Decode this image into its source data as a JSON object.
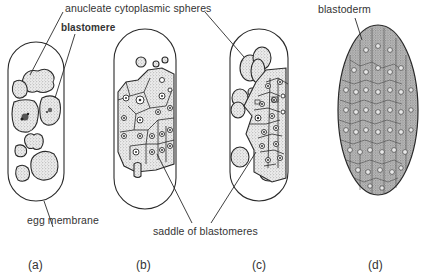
{
  "labels": {
    "anucleate": "anucleate cytoplasmic spheres",
    "blastomere": "blastomere",
    "egg_membrane": "egg membrane",
    "saddle": "saddle of blastomeres",
    "blastoderm": "blastoderm"
  },
  "panels": [
    {
      "id": "a",
      "label": "(a)"
    },
    {
      "id": "b",
      "label": "(b)"
    },
    {
      "id": "c",
      "label": "(c)"
    },
    {
      "id": "d",
      "label": "(d)"
    }
  ],
  "colors": {
    "stroke": "#2a2a2a",
    "stipple": "#c9c9c9",
    "cell_fill": "#e2e2e2",
    "dark_cell": "#b8b8b8",
    "blastoderm_fill": "#a9a9a9"
  }
}
